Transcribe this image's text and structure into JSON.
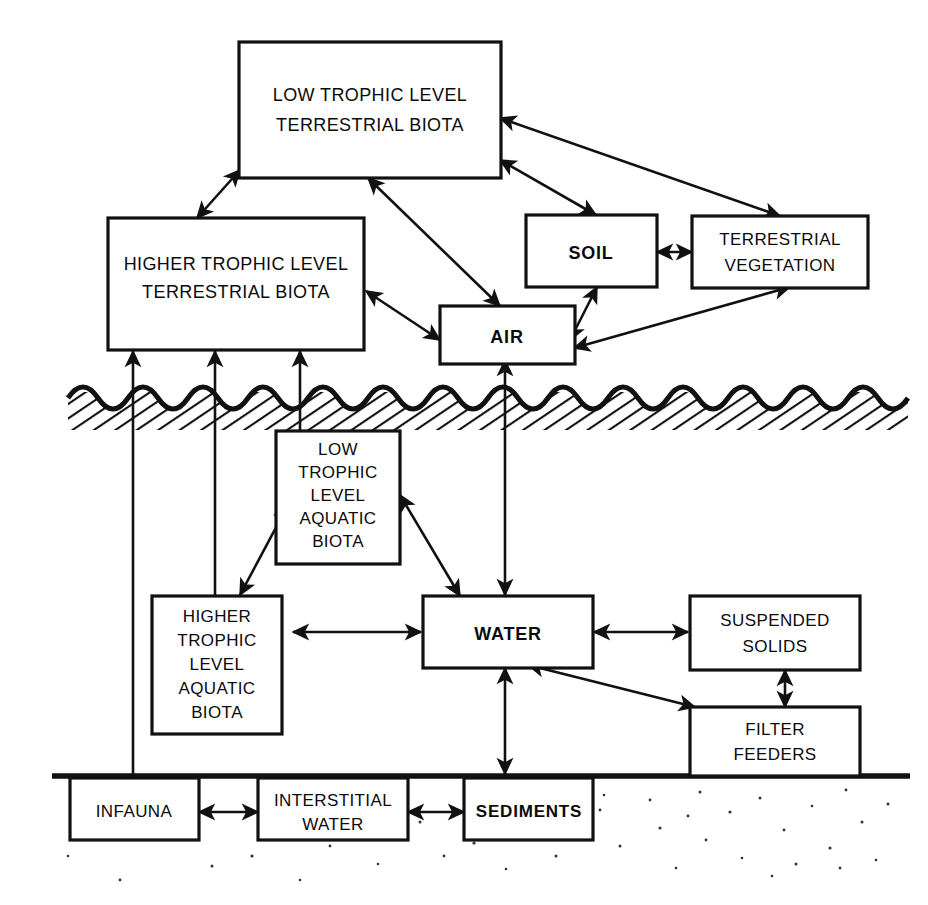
{
  "diagram": {
    "ink_color": "#111111",
    "background_color": "#ffffff",
    "surface_label": "water-surface-wavy-line",
    "bed_label": "sediment-bed-line",
    "boxes": {
      "low_terrestrial": {
        "lines": [
          "LOW TROPHIC  LEVEL",
          "TERRESTRIAL  BIOTA"
        ],
        "bold": false
      },
      "higher_terrestrial": {
        "lines": [
          "HIGHER TROPHIC  LEVEL",
          "TERRESTRIAL BIOTA"
        ],
        "bold": false
      },
      "soil": {
        "lines": [
          "SOIL"
        ],
        "bold": true
      },
      "terrestrial_vegetation": {
        "lines": [
          "TERRESTRIAL",
          "VEGETATION"
        ],
        "bold": false
      },
      "air": {
        "lines": [
          "AIR"
        ],
        "bold": true
      },
      "low_aquatic": {
        "lines": [
          "LOW",
          "TROPHIC",
          "LEVEL",
          "AQUATIC",
          "BIOTA"
        ],
        "bold": false
      },
      "higher_aquatic": {
        "lines": [
          "HIGHER",
          "TROPHIC",
          "LEVEL",
          "AQUATIC",
          "BIOTA"
        ],
        "bold": false
      },
      "water": {
        "lines": [
          "WATER"
        ],
        "bold": true
      },
      "suspended_solids": {
        "lines": [
          "SUSPENDED",
          "SOLIDS"
        ],
        "bold": false
      },
      "filter_feeders": {
        "lines": [
          "FILTER",
          "FEEDERS"
        ],
        "bold": false
      },
      "infauna": {
        "lines": [
          "INFAUNA"
        ],
        "bold": false
      },
      "interstitial_water": {
        "lines": [
          "INTERSTITIAL",
          "WATER"
        ],
        "bold": false
      },
      "sediments": {
        "lines": [
          "SEDIMENTS"
        ],
        "bold": true
      }
    },
    "connections": [
      {
        "from": "low_terrestrial",
        "to": "higher_terrestrial",
        "heads": "double"
      },
      {
        "from": "low_terrestrial",
        "to": "air",
        "heads": "double"
      },
      {
        "from": "low_terrestrial",
        "to": "soil",
        "heads": "double"
      },
      {
        "from": "low_terrestrial",
        "to": "terrestrial_vegetation",
        "heads": "double"
      },
      {
        "from": "higher_terrestrial",
        "to": "air",
        "heads": "double"
      },
      {
        "from": "soil",
        "to": "terrestrial_vegetation",
        "heads": "double"
      },
      {
        "from": "soil",
        "to": "air",
        "heads": "double"
      },
      {
        "from": "terrestrial_vegetation",
        "to": "air",
        "heads": "double"
      },
      {
        "from": "air",
        "to": "water",
        "heads": "double"
      },
      {
        "from": "infauna",
        "to": "higher_terrestrial",
        "heads": "single"
      },
      {
        "from": "higher_aquatic",
        "to": "higher_terrestrial",
        "heads": "single"
      },
      {
        "from": "low_aquatic",
        "to": "higher_terrestrial",
        "heads": "single"
      },
      {
        "from": "low_aquatic",
        "to": "higher_aquatic",
        "heads": "double"
      },
      {
        "from": "low_aquatic",
        "to": "water",
        "heads": "double"
      },
      {
        "from": "higher_aquatic",
        "to": "water",
        "heads": "double"
      },
      {
        "from": "water",
        "to": "suspended_solids",
        "heads": "double"
      },
      {
        "from": "water",
        "to": "filter_feeders",
        "heads": "double"
      },
      {
        "from": "suspended_solids",
        "to": "filter_feeders",
        "heads": "double"
      },
      {
        "from": "water",
        "to": "sediments",
        "heads": "double"
      },
      {
        "from": "infauna",
        "to": "interstitial_water",
        "heads": "double"
      },
      {
        "from": "interstitial_water",
        "to": "sediments",
        "heads": "double"
      }
    ]
  }
}
